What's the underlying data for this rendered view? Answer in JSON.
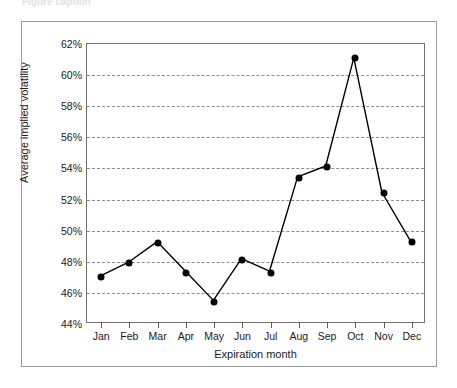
{
  "caption": "Figure caption",
  "chart_data": {
    "type": "line",
    "title": "",
    "xlabel": "Expiration month",
    "ylabel": "Average implied volatility",
    "categories": [
      "Jan",
      "Feb",
      "Mar",
      "Apr",
      "May",
      "Jun",
      "Jul",
      "Aug",
      "Sep",
      "Oct",
      "Nov",
      "Dec"
    ],
    "values": [
      47.0,
      47.9,
      49.2,
      47.3,
      45.4,
      48.1,
      47.3,
      53.4,
      54.1,
      61.1,
      52.4,
      49.3
    ],
    "series": [
      {
        "name": "Average implied volatility",
        "values": [
          47.0,
          47.9,
          49.2,
          47.3,
          45.4,
          48.1,
          47.3,
          53.4,
          54.1,
          61.1,
          52.4,
          49.3
        ]
      }
    ],
    "ylim": [
      44,
      62
    ],
    "ystep": 2,
    "yticks": [
      44,
      46,
      48,
      50,
      52,
      54,
      56,
      58,
      60,
      62
    ],
    "ytick_labels": [
      "44%",
      "46%",
      "48%",
      "50%",
      "52%",
      "54%",
      "56%",
      "58%",
      "60%",
      "62%"
    ],
    "unit": "%",
    "grid": true,
    "grid_style": "dashed-horizontal",
    "legend": false,
    "marker": "filled-circle",
    "line_color": "#000000",
    "marker_color": "#000000",
    "grid_color": "#8d8d8d",
    "frame_color": "#6f6f6f"
  }
}
